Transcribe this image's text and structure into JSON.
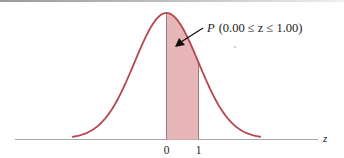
{
  "chart_data": {
    "type": "area",
    "title": "",
    "xlabel": "z",
    "ylabel": "",
    "tick_labels": [
      "0",
      "1"
    ],
    "tick_values": [
      0,
      1
    ],
    "xlim": [
      -3,
      3
    ],
    "shaded_region": {
      "from": 0.0,
      "to": 1.0
    },
    "annotation": "P (0.00 ≤ z ≤ 1.00)",
    "grid": false,
    "legend": "none",
    "colors": {
      "curve": "#b5474f",
      "fill": "#e6b3b6",
      "axis": "#999999"
    }
  },
  "labels": {
    "annotation_prefix": "P",
    "annotation_body": "(0.00 ≤ z ≤ 1.00)",
    "axis_var": "z",
    "tick0": "0",
    "tick1": "1"
  }
}
